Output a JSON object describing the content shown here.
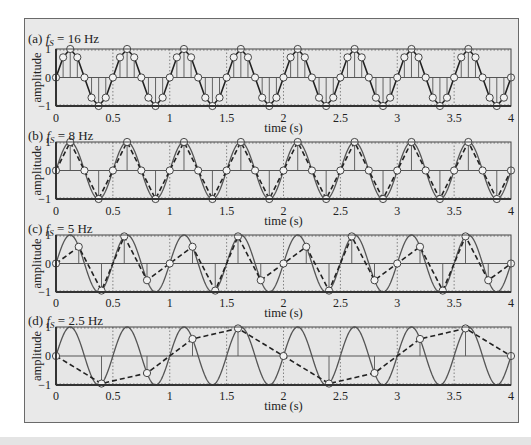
{
  "figure": {
    "colors": {
      "frame_bg": "#e9e9e9",
      "plot_bg": "#e6e6e6",
      "line": "#3a3a3a",
      "marker_fill": "#f2f2f2",
      "grid": "#555555"
    },
    "xlabel": "time (s)",
    "ylabel": "amplitude",
    "xticks": [
      0,
      0.5,
      1,
      1.5,
      2,
      2.5,
      3,
      3.5,
      4
    ],
    "xtick_labels": [
      "0",
      "0.5",
      "1",
      "1.5",
      "2",
      "2.5",
      "3",
      "3.5",
      "4"
    ],
    "yticks": [
      -1,
      0,
      1
    ],
    "ytick_labels": [
      "−1",
      "0",
      "1"
    ]
  },
  "chart_data": [
    {
      "type": "line",
      "panel": "a",
      "title": "(a) f_S = 16 Hz",
      "title_prefix": "(a) ",
      "title_sub": "S",
      "title_suffix": " = 16 Hz",
      "signal": "sin(2π·2·t)",
      "signal_frequency_hz": 2,
      "sampling_rate_hz": 16,
      "show_continuous": false,
      "reconstruction": "solid",
      "xlabel": "time (s)",
      "ylabel": "amplitude",
      "xlim": [
        0,
        4
      ],
      "ylim": [
        -1,
        1
      ],
      "samples_t": "n/16, n = 0..64",
      "samples_per_period": [
        0,
        0.707,
        1,
        0.707,
        0,
        -0.707,
        -1,
        -0.707
      ]
    },
    {
      "type": "line",
      "panel": "b",
      "title": "(b) f_S = 8 Hz",
      "title_prefix": "(b) ",
      "title_sub": "S",
      "title_suffix": " = 8 Hz",
      "signal": "sin(2π·2·t)",
      "signal_frequency_hz": 2,
      "sampling_rate_hz": 8,
      "show_continuous": true,
      "reconstruction": "dashed",
      "xlabel": "time (s)",
      "ylabel": "amplitude",
      "xlim": [
        0,
        4
      ],
      "ylim": [
        -1,
        1
      ],
      "samples_t": "n/8, n = 0..32",
      "samples_per_period": [
        0,
        1,
        0,
        -1
      ]
    },
    {
      "type": "line",
      "panel": "c",
      "title": "(c) f_S = 5 Hz",
      "title_prefix": "(c) ",
      "title_sub": "S",
      "title_suffix": " = 5 Hz",
      "signal": "sin(2π·2·t)",
      "signal_frequency_hz": 2,
      "sampling_rate_hz": 5,
      "show_continuous": true,
      "reconstruction": "dashed",
      "xlabel": "time (s)",
      "ylabel": "amplitude",
      "xlim": [
        0,
        4
      ],
      "ylim": [
        -1,
        1
      ],
      "samples_t": "n/5, n = 0..20",
      "samples_per_period": [
        0,
        0.588,
        -0.951,
        0.951,
        -0.588
      ]
    },
    {
      "type": "line",
      "panel": "d",
      "title": "(d) f_S = 2.5 Hz",
      "title_prefix": "(d) ",
      "title_sub": "S",
      "title_suffix": " = 2.5 Hz",
      "signal": "sin(2π·2·t)",
      "signal_frequency_hz": 2,
      "sampling_rate_hz": 2.5,
      "show_continuous": true,
      "reconstruction": "dashed",
      "xlabel": "time (s)",
      "ylabel": "amplitude",
      "xlim": [
        0,
        4
      ],
      "ylim": [
        -1,
        1
      ],
      "samples_t": "n/2.5, n = 0..10",
      "samples_per_period": [
        0,
        -0.951,
        -0.588,
        0.588,
        0.951
      ]
    }
  ],
  "layout": {
    "plot_left": 56,
    "plot_right": 511,
    "panels": [
      {
        "top": 49,
        "bottom": 106,
        "title_y": 34,
        "ticks_y": 122,
        "label_y": 128
      },
      {
        "top": 142,
        "bottom": 199,
        "title_y": 131,
        "ticks_y": 215,
        "label_y": 221
      },
      {
        "top": 235,
        "bottom": 292,
        "title_y": 224,
        "ticks_y": 307,
        "label_y": 313
      },
      {
        "top": 327,
        "bottom": 385,
        "title_y": 316,
        "ticks_y": 400,
        "label_y": 406
      }
    ]
  }
}
